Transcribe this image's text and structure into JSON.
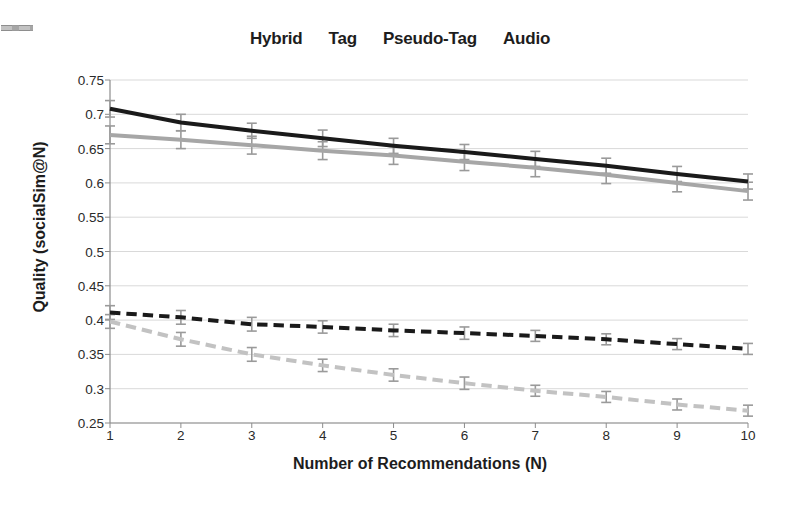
{
  "chart_data": {
    "type": "line",
    "title": "",
    "xlabel": "Number of Recommendations (N)",
    "ylabel": "Quality (socialSim@N)",
    "x": [
      1,
      2,
      3,
      4,
      5,
      6,
      7,
      8,
      9,
      10
    ],
    "xlim": [
      1,
      10
    ],
    "ylim": [
      0.25,
      0.75
    ],
    "yticks": [
      0.25,
      0.3,
      0.35,
      0.4,
      0.45,
      0.5,
      0.55,
      0.6,
      0.65,
      0.7,
      0.75
    ],
    "ytick_labels": [
      "0.25",
      "0.3",
      "0.35",
      "0.4",
      "0.45",
      "0.5",
      "0.55",
      "0.6",
      "0.65",
      "0.7",
      "0.75"
    ],
    "xtick_labels": [
      "1",
      "2",
      "3",
      "4",
      "5",
      "6",
      "7",
      "8",
      "9",
      "10"
    ],
    "grid": true,
    "grid_axis": "y",
    "legend_position": "top-center",
    "error_bars": true,
    "series": [
      {
        "name": "Hybrid",
        "color": "#1a1a1a",
        "style": "solid",
        "width": 4,
        "values": [
          0.708,
          0.688,
          0.676,
          0.665,
          0.654,
          0.645,
          0.635,
          0.625,
          0.613,
          0.602
        ],
        "errors": [
          0.012,
          0.012,
          0.011,
          0.012,
          0.011,
          0.011,
          0.011,
          0.011,
          0.011,
          0.011
        ]
      },
      {
        "name": "Tag",
        "color": "#a6a6a6",
        "style": "solid",
        "width": 4,
        "values": [
          0.67,
          0.663,
          0.655,
          0.647,
          0.64,
          0.631,
          0.622,
          0.612,
          0.6,
          0.588
        ],
        "errors": [
          0.013,
          0.013,
          0.013,
          0.013,
          0.013,
          0.013,
          0.013,
          0.013,
          0.013,
          0.013
        ]
      },
      {
        "name": "Pseudo-Tag",
        "color": "#1a1a1a",
        "style": "dashed",
        "width": 4,
        "values": [
          0.411,
          0.404,
          0.394,
          0.39,
          0.385,
          0.381,
          0.377,
          0.372,
          0.365,
          0.358
        ],
        "errors": [
          0.01,
          0.01,
          0.01,
          0.009,
          0.009,
          0.009,
          0.008,
          0.008,
          0.008,
          0.008
        ]
      },
      {
        "name": "Audio",
        "color": "#c2c2c2",
        "style": "dashed",
        "width": 4,
        "values": [
          0.398,
          0.372,
          0.35,
          0.334,
          0.32,
          0.308,
          0.297,
          0.288,
          0.277,
          0.268
        ],
        "errors": [
          0.01,
          0.01,
          0.01,
          0.009,
          0.009,
          0.009,
          0.008,
          0.008,
          0.008,
          0.008
        ]
      }
    ]
  },
  "legend": {
    "items": [
      {
        "label": "Hybrid",
        "color": "#1a1a1a",
        "style": "solid"
      },
      {
        "label": "Tag",
        "color": "#a6a6a6",
        "style": "solid"
      },
      {
        "label": "Pseudo-Tag",
        "color": "#1a1a1a",
        "style": "dashed"
      },
      {
        "label": "Audio",
        "color": "#c2c2c2",
        "style": "dashed"
      }
    ]
  },
  "axes": {
    "x_title": "Number of Recommendations (N)",
    "y_title": "Quality (socialSim@N)"
  },
  "style": {
    "background": "#ffffff",
    "grid_color": "#d9d9d9",
    "axis_color": "#8c8c8c",
    "text_color": "#1d1d1d",
    "error_bar_color": "#9a9a9a"
  }
}
